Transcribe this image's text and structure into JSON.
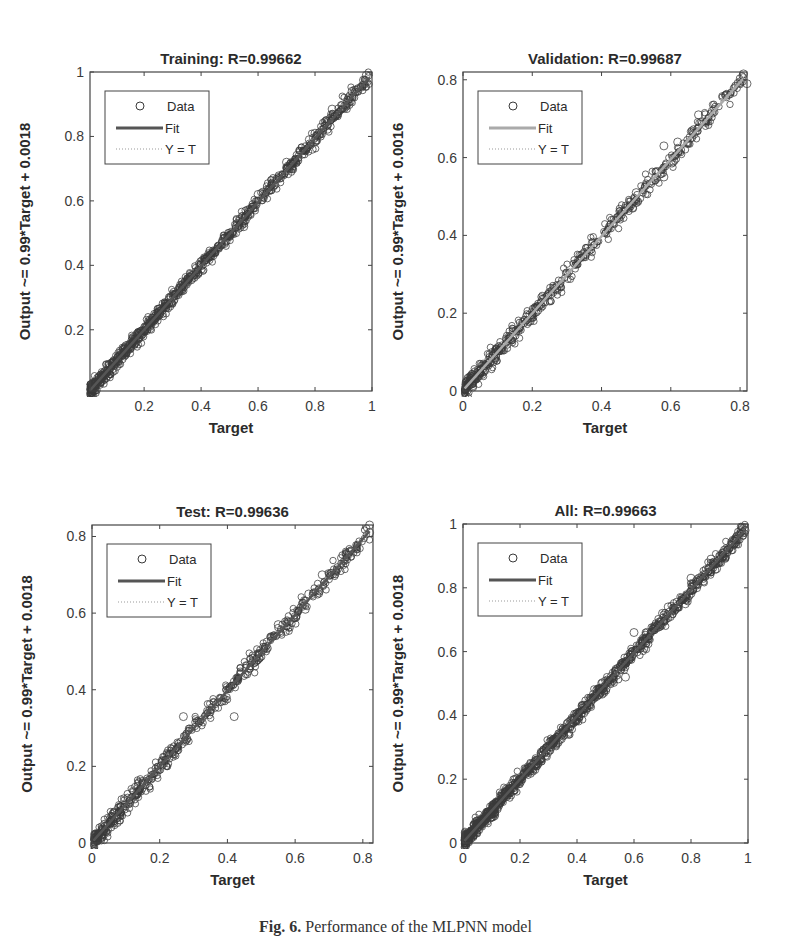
{
  "caption": {
    "label": "Fig. 6.",
    "text": "Performance of the MLPNN model"
  },
  "colors": {
    "data_marker": "#3a3a3a",
    "fit_line_dark": "#555555",
    "fit_line_light": "#aaaaaa",
    "identity_line": "#999999",
    "axes": "#444444"
  },
  "chart_data": [
    {
      "type": "scatter",
      "id": "training",
      "title": "Training: R=0.99662",
      "xlabel": "Target",
      "ylabel": "Output ~= 0.99*Target + 0.0018",
      "xlim": [
        0.01,
        1.0
      ],
      "ylim": [
        0.01,
        1.0
      ],
      "xticks": [
        0.2,
        0.4,
        0.6,
        0.8,
        1
      ],
      "xtick_labels": [
        "0.2",
        "0.4",
        "0.6",
        "0.8",
        "1"
      ],
      "yticks": [
        0.2,
        0.4,
        0.6,
        0.8,
        1
      ],
      "ytick_labels": [
        "0.2",
        "0.4",
        "0.6",
        "0.8",
        "1"
      ],
      "fit": {
        "slope": 0.99,
        "intercept": 0.0018
      },
      "fit_style": "dark",
      "R": 0.99662,
      "legend": [
        "Data",
        "Fit",
        "Y = T"
      ],
      "legend_position": "upper left",
      "grid": false,
      "data_range": [
        0.01,
        0.99
      ],
      "n_points": 900,
      "spread": 0.012,
      "outliers": [
        [
          0.98,
          0.99
        ],
        [
          0.97,
          0.975
        ],
        [
          0.93,
          0.94
        ],
        [
          0.88,
          0.87
        ],
        [
          0.86,
          0.885
        ],
        [
          0.8,
          0.81
        ],
        [
          0.78,
          0.79
        ],
        [
          0.79,
          0.76
        ],
        [
          0.72,
          0.7
        ],
        [
          0.7,
          0.72
        ],
        [
          0.6,
          0.62
        ],
        [
          0.55,
          0.52
        ]
      ],
      "box": {
        "x": 90,
        "y": 72,
        "w": 282,
        "h": 319
      }
    },
    {
      "type": "scatter",
      "id": "validation",
      "title": "Validation: R=0.99687",
      "xlabel": "Target",
      "ylabel": "Output ~= 0.99*Target + 0.0016",
      "xlim": [
        0,
        0.82
      ],
      "ylim": [
        0,
        0.82
      ],
      "xticks": [
        0,
        0.2,
        0.4,
        0.6,
        0.8
      ],
      "xtick_labels": [
        "0",
        "0.2",
        "0.4",
        "0.6",
        "0.8"
      ],
      "yticks": [
        0,
        0.2,
        0.4,
        0.6,
        0.8
      ],
      "ytick_labels": [
        "0",
        "0.2",
        "0.4",
        "0.6",
        "0.8"
      ],
      "fit": {
        "slope": 0.99,
        "intercept": 0.0016
      },
      "fit_style": "light",
      "R": 0.99687,
      "legend": [
        "Data",
        "Fit",
        "Y = T"
      ],
      "legend_position": "upper left",
      "grid": false,
      "data_range": [
        0.005,
        0.81
      ],
      "n_points": 550,
      "spread": 0.012,
      "outliers": [
        [
          0.81,
          0.815
        ],
        [
          0.82,
          0.79
        ],
        [
          0.76,
          0.76
        ],
        [
          0.72,
          0.72
        ],
        [
          0.7,
          0.71
        ],
        [
          0.68,
          0.71
        ],
        [
          0.58,
          0.63
        ],
        [
          0.62,
          0.64
        ],
        [
          0.58,
          0.55
        ],
        [
          0.49,
          0.47
        ],
        [
          0.5,
          0.51
        ]
      ],
      "box": {
        "x": 463,
        "y": 72,
        "w": 284,
        "h": 319
      }
    },
    {
      "type": "scatter",
      "id": "test",
      "title": "Test: R=0.99636",
      "xlabel": "Target",
      "ylabel": "Output ~= 0.99*Target + 0.0018",
      "xlim": [
        0,
        0.83
      ],
      "ylim": [
        0,
        0.83
      ],
      "xticks": [
        0,
        0.2,
        0.4,
        0.6,
        0.8
      ],
      "xtick_labels": [
        "0",
        "0.2",
        "0.4",
        "0.6",
        "0.8"
      ],
      "yticks": [
        0,
        0.2,
        0.4,
        0.6,
        0.8
      ],
      "ytick_labels": [
        "0",
        "0.2",
        "0.4",
        "0.6",
        "0.8"
      ],
      "fit": {
        "slope": 0.99,
        "intercept": 0.0018
      },
      "fit_style": "dark",
      "R": 0.99636,
      "legend": [
        "Data",
        "Fit",
        "Y = T"
      ],
      "legend_position": "upper left",
      "grid": false,
      "data_range": [
        0.005,
        0.82
      ],
      "n_points": 550,
      "spread": 0.012,
      "outliers": [
        [
          0.82,
          0.83
        ],
        [
          0.82,
          0.81
        ],
        [
          0.76,
          0.76
        ],
        [
          0.68,
          0.7
        ],
        [
          0.67,
          0.66
        ],
        [
          0.64,
          0.65
        ],
        [
          0.63,
          0.61
        ],
        [
          0.55,
          0.57
        ],
        [
          0.42,
          0.33
        ],
        [
          0.27,
          0.33
        ]
      ],
      "box": {
        "x": 92,
        "y": 525,
        "w": 281,
        "h": 318
      }
    },
    {
      "type": "scatter",
      "id": "all",
      "title": "All: R=0.99663",
      "xlabel": "Target",
      "ylabel": "Output ~= 0.99*Target + 0.0018",
      "xlim": [
        0,
        1.0
      ],
      "ylim": [
        0,
        1.0
      ],
      "xticks": [
        0,
        0.2,
        0.4,
        0.6,
        0.8,
        1
      ],
      "xtick_labels": [
        "0",
        "0.2",
        "0.4",
        "0.6",
        "0.8",
        "1"
      ],
      "yticks": [
        0,
        0.2,
        0.4,
        0.6,
        0.8,
        1
      ],
      "ytick_labels": [
        "0",
        "0.2",
        "0.4",
        "0.6",
        "0.8",
        "1"
      ],
      "fit": {
        "slope": 0.99,
        "intercept": 0.0018
      },
      "fit_style": "dark",
      "R": 0.99663,
      "legend": [
        "Data",
        "Fit",
        "Y = T"
      ],
      "legend_position": "upper left",
      "grid": false,
      "data_range": [
        0.005,
        0.99
      ],
      "n_points": 1100,
      "spread": 0.012,
      "outliers": [
        [
          0.99,
          0.98
        ],
        [
          0.98,
          0.99
        ],
        [
          0.96,
          0.95
        ],
        [
          0.93,
          0.92
        ],
        [
          0.89,
          0.86
        ],
        [
          0.87,
          0.89
        ],
        [
          0.82,
          0.8
        ],
        [
          0.8,
          0.83
        ],
        [
          0.78,
          0.75
        ],
        [
          0.72,
          0.74
        ],
        [
          0.7,
          0.72
        ],
        [
          0.6,
          0.66
        ],
        [
          0.57,
          0.52
        ]
      ],
      "box": {
        "x": 463,
        "y": 524,
        "w": 285,
        "h": 319
      }
    }
  ]
}
